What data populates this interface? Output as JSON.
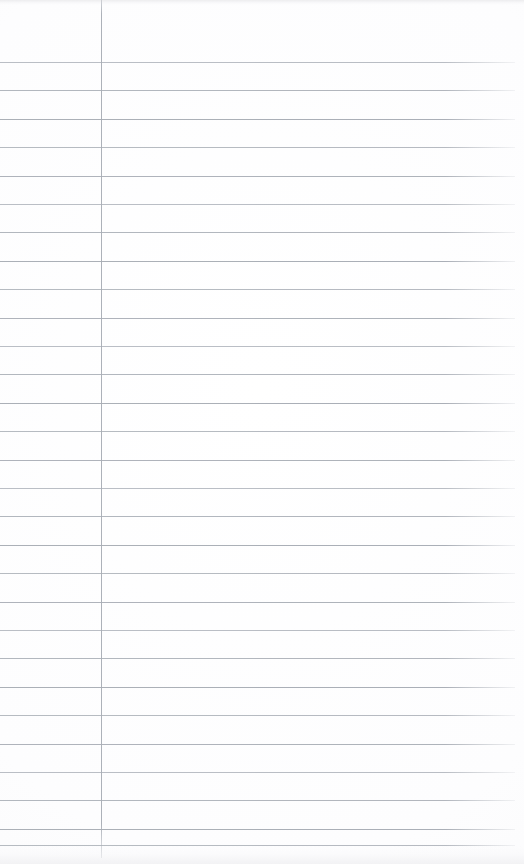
{
  "document": {
    "kind": "lined-notebook-page",
    "title": "Blank Lined Notebook Page",
    "description": "Scanned blank ruled notepad sheet with a vertical left margin rule",
    "page_width": 524,
    "page_height": 864,
    "content_text": "",
    "is_blank": true
  },
  "paper": {
    "background_color": "#fdfdfe",
    "edge_shadow_color": "#ececee",
    "surface_label": "paper-surface"
  },
  "ruling": {
    "style": "wide-ruled",
    "rule_color": "#a9aeb6",
    "rule_thickness_px": 1,
    "line_spacing_px": 28.4,
    "first_line_y": 62,
    "last_line_y": 845,
    "line_count": 29,
    "rule_left_x": 0,
    "rule_right_x": 515,
    "line_positions": [
      62,
      90.4,
      118.8,
      147.2,
      175.6,
      204,
      232.4,
      260.8,
      289.2,
      317.6,
      346,
      374.4,
      402.8,
      431.2,
      459.6,
      488,
      516.4,
      544.8,
      573.2,
      601.6,
      630,
      658.4,
      686.8,
      715.2,
      743.6,
      772,
      800.4,
      828.8,
      845
    ]
  },
  "margin_rule": {
    "label": "left-margin-rule",
    "x_position": 101,
    "color": "#a8adb5",
    "thickness_px": 1,
    "top_y": 0,
    "bottom_y": 858
  },
  "regions": {
    "margin_column_label": "Left margin column",
    "writing_area_label": "Writing area",
    "header_area_label": "Unruled header area"
  }
}
